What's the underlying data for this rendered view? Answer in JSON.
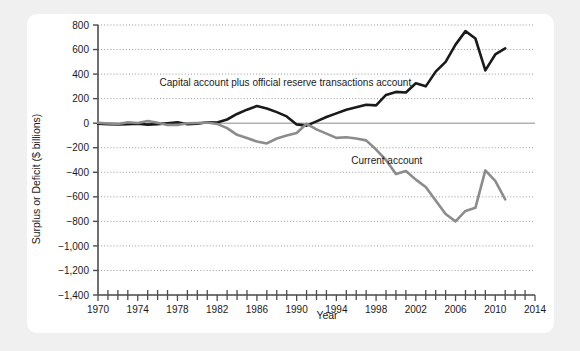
{
  "chart_data": {
    "type": "line",
    "title": "",
    "xlabel": "Year",
    "ylabel": "Surplus or Deficit ($ billions)",
    "xlim": [
      1970,
      2014
    ],
    "ylim": [
      -1400,
      800
    ],
    "grid": true,
    "legend_position": "inline-annotation",
    "x_ticks_major": [
      1970,
      1974,
      1978,
      1982,
      1986,
      1990,
      1994,
      1998,
      2002,
      2006,
      2010,
      2014
    ],
    "x_tick_labels": [
      "1970",
      "1974",
      "1978",
      "1982",
      "1986",
      "1990",
      "1994",
      "1998",
      "2002",
      "2006",
      "2010",
      "2014"
    ],
    "x_tick_minor_step": 1,
    "y_ticks": [
      800,
      600,
      400,
      200,
      0,
      -200,
      -400,
      -600,
      -800,
      -1000,
      -1200,
      -1400
    ],
    "y_tick_labels": [
      "800",
      "600",
      "400",
      "200",
      "0",
      "−200",
      "−400",
      "−600",
      "−800",
      "−1,000",
      "−1,200",
      "−1,400"
    ],
    "zero_line": 0,
    "series": [
      {
        "name": "Capital account plus official reserve transactions account",
        "color": "#1a1a1a",
        "width": 2.6,
        "annotation_text": "Capital account plus official reserve transactions account",
        "annotation_x": 1976.2,
        "annotation_y": 300,
        "x": [
          1970,
          1971,
          1972,
          1973,
          1974,
          1975,
          1976,
          1977,
          1978,
          1979,
          1980,
          1981,
          1982,
          1983,
          1984,
          1985,
          1986,
          1987,
          1988,
          1989,
          1990,
          1991,
          1992,
          1993,
          1994,
          1995,
          1996,
          1997,
          1998,
          1999,
          2000,
          2001,
          2002,
          2003,
          2004,
          2005,
          2006,
          2007,
          2008,
          2009,
          2010,
          2011
        ],
        "values": [
          -5,
          -8,
          -10,
          -8,
          -5,
          -12,
          -8,
          0,
          8,
          -8,
          -5,
          8,
          5,
          30,
          75,
          110,
          140,
          120,
          90,
          55,
          -10,
          -20,
          15,
          50,
          80,
          110,
          130,
          150,
          145,
          230,
          255,
          250,
          325,
          300,
          420,
          500,
          640,
          750,
          690,
          430,
          560,
          610
        ]
      },
      {
        "name": "Current account",
        "color": "#8c8c8c",
        "width": 2.6,
        "annotation_text": "Current account",
        "annotation_x": 1995.5,
        "annotation_y": -330,
        "x": [
          1970,
          1971,
          1972,
          1973,
          1974,
          1975,
          1976,
          1977,
          1978,
          1979,
          1980,
          1981,
          1982,
          1983,
          1984,
          1985,
          1986,
          1987,
          1988,
          1989,
          1990,
          1991,
          1992,
          1993,
          1994,
          1995,
          1996,
          1997,
          1998,
          1999,
          2000,
          2001,
          2002,
          2003,
          2004,
          2005,
          2006,
          2007,
          2008,
          2009,
          2010,
          2011
        ],
        "values": [
          3,
          -2,
          -6,
          7,
          2,
          18,
          4,
          -14,
          -15,
          -1,
          2,
          5,
          -6,
          -40,
          -95,
          -120,
          -150,
          -165,
          -125,
          -100,
          -80,
          -5,
          -50,
          -85,
          -120,
          -115,
          -125,
          -140,
          -215,
          -300,
          -415,
          -390,
          -460,
          -520,
          -630,
          -740,
          -800,
          -715,
          -690,
          -385,
          -470,
          -620
        ]
      }
    ]
  },
  "axis": {
    "y_title": "Surplus or Deficit ($ billions)",
    "x_title": "Year"
  },
  "colors": {
    "page_background": "#f0f0f0",
    "card_background": "#ffffff",
    "axis": "#4d4d4d",
    "gridline": "#8c8c8c",
    "zero_line": "#8c8c8c",
    "series_black": "#1a1a1a",
    "series_gray": "#8c8c8c",
    "text": "#1a1a1a"
  }
}
